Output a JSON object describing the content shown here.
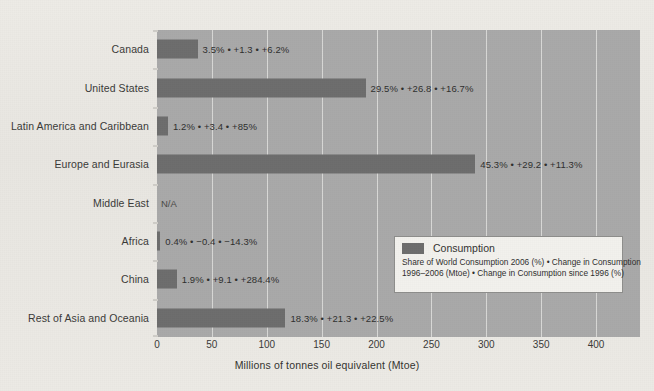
{
  "chart_data": {
    "type": "bar",
    "orientation": "horizontal",
    "title": "",
    "xlabel": "Millions of tonnes oil equivalent (Mtoe)",
    "ylabel": "",
    "xlim": [
      0,
      440
    ],
    "xticks": [
      0,
      50,
      100,
      150,
      200,
      250,
      300,
      350,
      400
    ],
    "grid": true,
    "legend_position": "inside-bottom-right",
    "categories": [
      "Canada",
      "United States",
      "Latin America and Caribbean",
      "Europe and Eurasia",
      "Middle East",
      "Africa",
      "China",
      "Rest of Asia and Oceania"
    ],
    "series": [
      {
        "name": "Consumption",
        "color": "#6d6d6d",
        "values": [
          37,
          190,
          10,
          290,
          null,
          3,
          18,
          117
        ]
      }
    ],
    "data_labels": [
      "3.5% • +1.3 • +6.2%",
      "29.5% • +26.8 • +16.7%",
      "1.2% • +3.4 • +85%",
      "45.3% • +29.2 • +11.3%",
      "N/A",
      "0.4% • −0.4 • −14.3%",
      "1.9% • +9.1 • +284.4%",
      "18.3% • +21.3 • +22.5%"
    ],
    "points": [
      {
        "category": "Canada",
        "value": 37,
        "share_of_world_consumption_2006_pct": 3.5,
        "change_in_consumption_1996_2006_mtoe": 1.3,
        "change_in_consumption_since_1996_pct": 6.2,
        "label": "3.5% • +1.3 • +6.2%"
      },
      {
        "category": "United States",
        "value": 190,
        "share_of_world_consumption_2006_pct": 29.5,
        "change_in_consumption_1996_2006_mtoe": 26.8,
        "change_in_consumption_since_1996_pct": 16.7,
        "label": "29.5% • +26.8 • +16.7%"
      },
      {
        "category": "Latin America and Caribbean",
        "value": 10,
        "share_of_world_consumption_2006_pct": 1.2,
        "change_in_consumption_1996_2006_mtoe": 3.4,
        "change_in_consumption_since_1996_pct": 85,
        "label": "1.2% • +3.4 • +85%"
      },
      {
        "category": "Europe and Eurasia",
        "value": 290,
        "share_of_world_consumption_2006_pct": 45.3,
        "change_in_consumption_1996_2006_mtoe": 29.2,
        "change_in_consumption_since_1996_pct": 11.3,
        "label": "45.3% • +29.2 • +11.3%"
      },
      {
        "category": "Middle East",
        "value": null,
        "share_of_world_consumption_2006_pct": null,
        "change_in_consumption_1996_2006_mtoe": null,
        "change_in_consumption_since_1996_pct": null,
        "label": "N/A"
      },
      {
        "category": "Africa",
        "value": 3,
        "share_of_world_consumption_2006_pct": 0.4,
        "change_in_consumption_1996_2006_mtoe": -0.4,
        "change_in_consumption_since_1996_pct": -14.3,
        "label": "0.4% • −0.4 • −14.3%"
      },
      {
        "category": "China",
        "value": 18,
        "share_of_world_consumption_2006_pct": 1.9,
        "change_in_consumption_1996_2006_mtoe": 9.1,
        "change_in_consumption_since_1996_pct": 284.4,
        "label": "1.9% • +9.1 • +284.4%"
      },
      {
        "category": "Rest of Asia and Oceania",
        "value": 117,
        "share_of_world_consumption_2006_pct": 18.3,
        "change_in_consumption_1996_2006_mtoe": 21.3,
        "change_in_consumption_since_1996_pct": 22.5,
        "label": "18.3% • +21.3 • +22.5%"
      }
    ]
  },
  "legend": {
    "series_label": "Consumption",
    "description_line1": "Share of World Consumption 2006 (%) • Change in Consumption",
    "description_line2": "1996–2006 (Mtoe) • Change in Consumption since 1996 (%)"
  },
  "axis": {
    "x_title": "Millions of tonnes oil equivalent (Mtoe)",
    "x_tick_labels": [
      "0",
      "50",
      "100",
      "150",
      "200",
      "250",
      "300",
      "350",
      "400"
    ]
  },
  "colors": {
    "bar": "#6d6d6d",
    "panel": "#a9a9a9",
    "page": "#e9e7e2",
    "gridline": "#d8d8d6",
    "legend_background": "#f2f1ed",
    "text": "#33332f"
  }
}
